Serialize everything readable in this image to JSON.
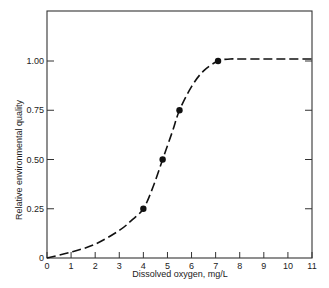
{
  "chart_data": {
    "type": "line",
    "title": "",
    "xlabel": "Dissolved oxygen, mg/L",
    "ylabel": "Relative environmental quality",
    "xlim": [
      0,
      11
    ],
    "ylim": [
      0,
      1.2
    ],
    "x_ticks": [
      "0",
      "1",
      "2",
      "3",
      "4",
      "5",
      "6",
      "7",
      "8",
      "9",
      "10",
      "11"
    ],
    "y_ticks": [
      "0",
      "0.25",
      "0.50",
      "0.75",
      "1.00"
    ],
    "grid": false,
    "legend": null,
    "series": [
      {
        "name": "curve",
        "style": "dashed",
        "x": [
          0,
          1,
          2,
          3,
          3.5,
          4,
          4.4,
          4.8,
          5.2,
          5.5,
          6,
          6.5,
          7.1,
          7.6,
          8,
          9,
          10,
          11
        ],
        "y": [
          0,
          0.03,
          0.07,
          0.14,
          0.19,
          0.25,
          0.36,
          0.5,
          0.64,
          0.75,
          0.87,
          0.95,
          1.0,
          1.01,
          1.01,
          1.01,
          1.01,
          1.01
        ]
      },
      {
        "name": "points",
        "style": "markers",
        "x": [
          4.0,
          4.8,
          5.5,
          7.1
        ],
        "y": [
          0.25,
          0.5,
          0.75,
          1.0
        ]
      }
    ]
  }
}
